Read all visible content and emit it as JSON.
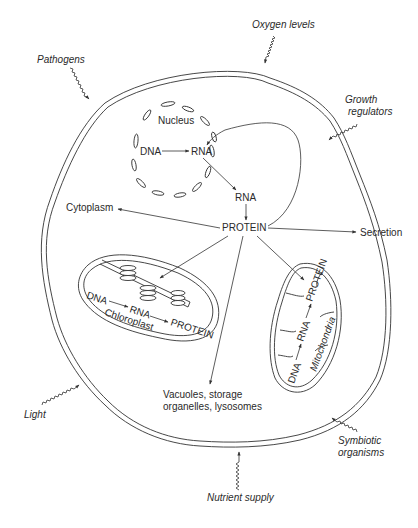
{
  "diagram": {
    "type": "cell-schematic",
    "title": "",
    "external_factors": [
      {
        "id": "pathogens",
        "label": "Pathogens"
      },
      {
        "id": "oxygen",
        "label": "Oxygen levels"
      },
      {
        "id": "growth",
        "label": "Growth regulators",
        "lines": [
          "Growth",
          "regulators"
        ]
      },
      {
        "id": "light",
        "label": "Light"
      },
      {
        "id": "symbiotic",
        "label": "Symbiotic organisms",
        "lines": [
          "Symbiotic",
          "organisms"
        ]
      },
      {
        "id": "nutrient",
        "label": "Nutrient supply"
      }
    ],
    "nucleus": {
      "label": "Nucleus",
      "dna": "DNA",
      "rna": "RNA"
    },
    "cytosol": {
      "rna": "RNA",
      "protein": "PROTEIN"
    },
    "destinations": {
      "cytoplasm": "Cytoplasm",
      "secretion": "Secretion",
      "vacuoles_lines": [
        "Vacuoles, storage",
        "organelles, lysosomes"
      ],
      "vacuoles": "Vacuoles, storage organelles, lysosomes"
    },
    "chloroplast": {
      "label": "Chloroplast",
      "dna": "DNA",
      "rna": "RNA",
      "protein": "PROTEIN"
    },
    "mitochondria": {
      "label": "Mitochondria",
      "dna": "DNA",
      "rna": "RNA",
      "protein": "PROTEIN"
    },
    "flows": [
      {
        "from": "nucleus.DNA",
        "to": "nucleus.RNA"
      },
      {
        "from": "nucleus.RNA",
        "to": "cytosol.RNA"
      },
      {
        "from": "cytosol.RNA",
        "to": "cytosol.PROTEIN"
      },
      {
        "from": "cytosol.PROTEIN",
        "to": "nucleus.RNA"
      },
      {
        "from": "cytosol.PROTEIN",
        "to": "Cytoplasm"
      },
      {
        "from": "cytosol.PROTEIN",
        "to": "Secretion"
      },
      {
        "from": "cytosol.PROTEIN",
        "to": "Chloroplast"
      },
      {
        "from": "cytosol.PROTEIN",
        "to": "Mitochondria"
      },
      {
        "from": "cytosol.PROTEIN",
        "to": "Vacuoles, storage organelles, lysosomes"
      },
      {
        "from": "chloroplast.DNA",
        "to": "chloroplast.RNA"
      },
      {
        "from": "chloroplast.RNA",
        "to": "chloroplast.PROTEIN"
      },
      {
        "from": "mitochondria.DNA",
        "to": "mitochondria.RNA"
      },
      {
        "from": "mitochondria.RNA",
        "to": "mitochondria.PROTEIN"
      }
    ],
    "colors": {
      "line": "#333333",
      "text": "#2a2a2a",
      "background": "#ffffff"
    }
  }
}
